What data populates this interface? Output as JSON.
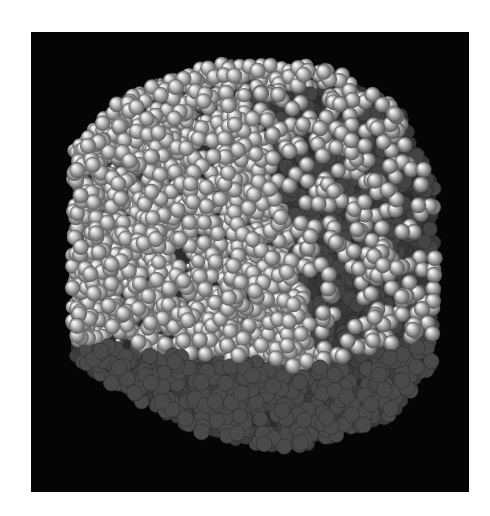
{
  "figure": {
    "background_color": "#050505",
    "page_color": "#ffffff",
    "frame": {
      "x": 31,
      "y": 32,
      "width": 438,
      "height": 460
    },
    "cube": {
      "front_left_face": {
        "tone": "bright",
        "oxygen_color": "#cfcfcf",
        "hydrogen_color": "#5a5a5a"
      },
      "right_face": {
        "tone": "mid",
        "oxygen_color": "#bdbdbd",
        "hydrogen_color": "#4a4a4a",
        "base_color": "#3a3a3a"
      },
      "bottom_face": {
        "tone": "dark",
        "oxygen_color": "#555555",
        "hydrogen_color": "#383838"
      }
    },
    "render": {
      "sphere_radius": 7,
      "seed": 7,
      "top_face_points": [
        [
          120,
          28
        ],
        [
          340,
          35
        ],
        [
          420,
          165
        ],
        [
          205,
          160
        ]
      ],
      "silhouette": {
        "left": 40,
        "right": 400,
        "top": 25,
        "bottom": 390
      }
    }
  }
}
